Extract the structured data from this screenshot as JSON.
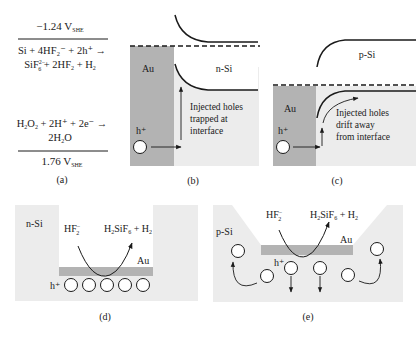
{
  "panel_a": {
    "top_potential": {
      "value": "−1.24 V",
      "sub": "SHE"
    },
    "reaction1_line1": "Si + 4HF₂⁻ + 2h⁺ →",
    "reaction1_line2": {
      "a": "SiF",
      "a_sub": "6",
      "a_sup": "2−",
      "b": " + 2HF",
      "b_sub": "2",
      "c": " + H",
      "c_sub": "2"
    },
    "reaction2_line1": {
      "a": "H",
      "a_sub": "2",
      "b": "O",
      "b_sub": "2",
      "c": " + 2H⁺ + 2e⁻ →"
    },
    "reaction2_line2": {
      "a": "2H",
      "a_sub": "2",
      "b": "O"
    },
    "bottom_potential": {
      "value": "1.76 V",
      "sub": "SHE"
    },
    "caption": "(a)"
  },
  "panel_b": {
    "metal_label": "Au",
    "semiconductor_label": "n-Si",
    "carrier_label": "h⁺",
    "annotation": [
      "Injected holes",
      "trapped at",
      "interface"
    ],
    "caption": "(b)"
  },
  "panel_c": {
    "metal_label": "Au",
    "semiconductor_label": "p-Si",
    "carrier_label": "h⁺",
    "annotation": [
      "Injected holes",
      "drift away",
      "from interface"
    ],
    "caption": "(c)"
  },
  "panel_d": {
    "semiconductor_label": "n-Si",
    "reactant": {
      "a": "HF",
      "sub": "2",
      "sup": "−"
    },
    "product": {
      "a": "H",
      "a_sub": "2",
      "b": "SiF",
      "b_sub": "6",
      "c": " + H",
      "c_sub": "2"
    },
    "metal_label": "Au",
    "carrier_label": "h⁺",
    "hole_count": 5,
    "caption": "(d)"
  },
  "panel_e": {
    "semiconductor_label": "p-Si",
    "reactant": {
      "a": "HF",
      "sub": "2",
      "sup": "−"
    },
    "product": {
      "a": "H",
      "a_sub": "2",
      "b": "SiF",
      "b_sub": "6",
      "c": " + H",
      "c_sub": "2"
    },
    "metal_label": "Au",
    "carrier_label": "h⁺",
    "caption": "(e)"
  },
  "colors": {
    "metal": "#b3b3b3",
    "semiconductor": "#ececec",
    "line": "#1a1a1a",
    "background": "#ffffff"
  }
}
